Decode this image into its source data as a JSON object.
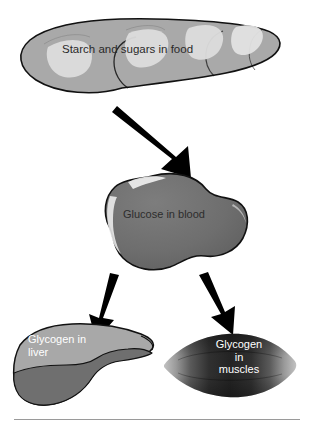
{
  "diagram": {
    "nodes": [
      {
        "id": "food",
        "label": "Starch and sugars in food",
        "shape": "bread-loaf",
        "fill": "#a9a9a9",
        "highlight": "#dcdcdc",
        "outline": "#1a1a1a",
        "text_color": "#2a2a2a"
      },
      {
        "id": "glucose",
        "label": "Glucose in blood",
        "shape": "blood-blob",
        "fill": "#6e6e6e",
        "highlight": "#f0f0f0",
        "outline": "#1a1a1a",
        "text_color": "#2d2d2d"
      },
      {
        "id": "liver",
        "label": "Glycogen in\nliver",
        "shape": "liver-organ",
        "fill": "#a8a8a8",
        "fill_lower": "#6f6f6f",
        "outline": "#1a1a1a",
        "text_color": "#ffffff"
      },
      {
        "id": "muscles",
        "label": "Glycogen\nin\nmuscles",
        "shape": "muscle-spindle",
        "fill": "#2b2b2b",
        "fill_edge": "#b5b5b5",
        "text_color": "#ffffff"
      }
    ],
    "arrows": [
      {
        "id": "food-to-glucose",
        "from": "food",
        "to": "glucose",
        "color": "#000000"
      },
      {
        "id": "glucose-to-liver",
        "from": "glucose",
        "to": "liver",
        "color": "#000000"
      },
      {
        "id": "glucose-to-muscles",
        "from": "glucose",
        "to": "muscles",
        "color": "#000000"
      }
    ],
    "rule": {
      "id": "bottom-rule",
      "color": "#9a9a9a"
    },
    "background": "#ffffff"
  }
}
